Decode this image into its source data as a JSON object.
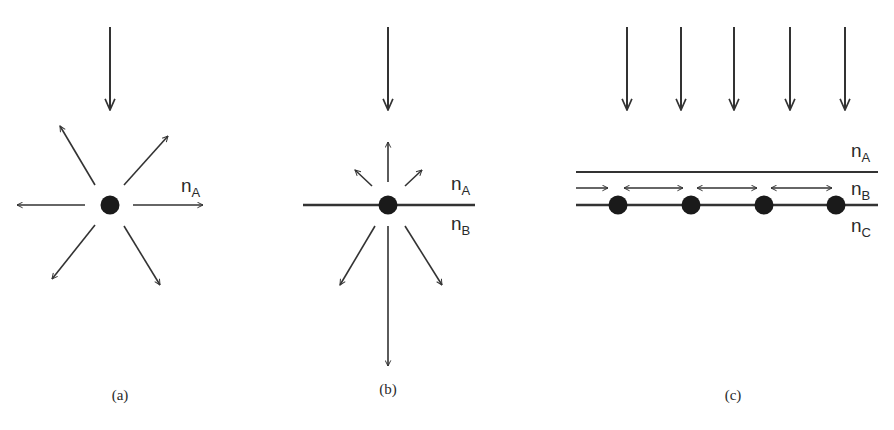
{
  "panels": [
    {
      "id": "a",
      "caption": "(a)",
      "media_labels": [
        {
          "main": "n",
          "sub": "A"
        }
      ],
      "description": "Point scatterer in homogeneous medium radiating isotropically"
    },
    {
      "id": "b",
      "caption": "(b)",
      "media_labels": [
        {
          "main": "n",
          "sub": "A"
        },
        {
          "main": "n",
          "sub": "B"
        }
      ],
      "description": "Scatterer on an interface radiating preferentially into higher-index medium"
    },
    {
      "id": "c",
      "caption": "(c)",
      "media_labels": [
        {
          "main": "n",
          "sub": "A"
        },
        {
          "main": "n",
          "sub": "B"
        },
        {
          "main": "n",
          "sub": "C"
        }
      ],
      "description": "Array of scatterers coupling light into a guided layer"
    }
  ],
  "colors": {
    "stroke": "#333333",
    "dot": "#1a1a1a",
    "text": "#2a2a2a"
  }
}
